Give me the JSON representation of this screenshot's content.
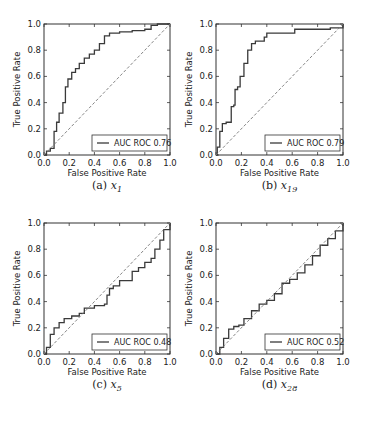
{
  "chart_data": [
    {
      "type": "line",
      "id": "a",
      "caption": {
        "label": "(a)",
        "var": "x",
        "sub": "1"
      },
      "xlabel": "False Positive Rate",
      "ylabel": "True Positive Rate",
      "xlim": [
        0,
        1
      ],
      "ylim": [
        0,
        1
      ],
      "xticks": [
        "0.0",
        "0.2",
        "0.4",
        "0.6",
        "0.8",
        "1.0"
      ],
      "yticks": [
        "0.0",
        "0.2",
        "0.4",
        "0.6",
        "0.8",
        "1.0"
      ],
      "legend": {
        "label": "AUC ROC 0.76",
        "position": "lower right"
      },
      "series": [
        {
          "name": "AUC ROC 0.76",
          "auc": 0.76,
          "x": [
            0.0,
            0.02,
            0.05,
            0.08,
            0.1,
            0.12,
            0.15,
            0.17,
            0.19,
            0.22,
            0.25,
            0.28,
            0.32,
            0.36,
            0.4,
            0.44,
            0.48,
            0.52,
            0.6,
            0.7,
            0.8,
            0.85,
            0.9,
            1.0
          ],
          "y": [
            0.0,
            0.03,
            0.05,
            0.18,
            0.25,
            0.32,
            0.4,
            0.52,
            0.58,
            0.63,
            0.66,
            0.7,
            0.74,
            0.77,
            0.8,
            0.85,
            0.91,
            0.93,
            0.94,
            0.95,
            0.96,
            0.99,
            1.0,
            1.0
          ]
        },
        {
          "name": "chance",
          "style": "dashed",
          "x": [
            0,
            1
          ],
          "y": [
            0,
            1
          ]
        }
      ]
    },
    {
      "type": "line",
      "id": "b",
      "caption": {
        "label": "(b)",
        "var": "x",
        "sub": "19"
      },
      "xlabel": "False Positive Rate",
      "ylabel": "True Positive Rate",
      "xlim": [
        0,
        1
      ],
      "ylim": [
        0,
        1
      ],
      "xticks": [
        "0.0",
        "0.2",
        "0.4",
        "0.6",
        "0.8",
        "1.0"
      ],
      "yticks": [
        "0.0",
        "0.2",
        "0.4",
        "0.6",
        "0.8",
        "1.0"
      ],
      "legend": {
        "label": "AUC ROC 0.79",
        "position": "lower right"
      },
      "series": [
        {
          "name": "AUC ROC 0.79",
          "auc": 0.79,
          "x": [
            0.0,
            0.01,
            0.03,
            0.05,
            0.08,
            0.1,
            0.12,
            0.14,
            0.15,
            0.17,
            0.19,
            0.22,
            0.25,
            0.28,
            0.31,
            0.35,
            0.38,
            0.4,
            0.5,
            0.6,
            0.62,
            0.8,
            0.9,
            1.0
          ],
          "y": [
            0.0,
            0.06,
            0.18,
            0.24,
            0.25,
            0.25,
            0.37,
            0.38,
            0.5,
            0.52,
            0.6,
            0.7,
            0.8,
            0.85,
            0.87,
            0.87,
            0.9,
            0.93,
            0.93,
            0.93,
            0.96,
            0.96,
            0.97,
            1.0
          ]
        },
        {
          "name": "chance",
          "style": "dashed",
          "x": [
            0,
            1
          ],
          "y": [
            0,
            1
          ]
        }
      ]
    },
    {
      "type": "line",
      "id": "c",
      "caption": {
        "label": "(c)",
        "var": "x",
        "sub": "5"
      },
      "xlabel": "False Positive Rate",
      "ylabel": "True Positive Rate",
      "xlim": [
        0,
        1
      ],
      "ylim": [
        0,
        1
      ],
      "xticks": [
        "0.0",
        "0.2",
        "0.4",
        "0.6",
        "0.8",
        "1.0"
      ],
      "yticks": [
        "0.0",
        "0.2",
        "0.4",
        "0.6",
        "0.8",
        "1.0"
      ],
      "legend": {
        "label": "AUC ROC 0.48",
        "position": "lower right"
      },
      "series": [
        {
          "name": "AUC ROC 0.48",
          "auc": 0.48,
          "x": [
            0.0,
            0.02,
            0.05,
            0.08,
            0.12,
            0.16,
            0.22,
            0.28,
            0.32,
            0.35,
            0.4,
            0.48,
            0.5,
            0.52,
            0.55,
            0.6,
            0.65,
            0.7,
            0.75,
            0.8,
            0.85,
            0.88,
            0.92,
            0.95,
            1.0
          ],
          "y": [
            0.0,
            0.05,
            0.15,
            0.2,
            0.24,
            0.27,
            0.29,
            0.31,
            0.35,
            0.35,
            0.37,
            0.38,
            0.45,
            0.5,
            0.52,
            0.56,
            0.56,
            0.63,
            0.66,
            0.7,
            0.73,
            0.8,
            0.87,
            0.95,
            1.0
          ]
        },
        {
          "name": "chance",
          "style": "dashed",
          "x": [
            0,
            1
          ],
          "y": [
            0,
            1
          ]
        }
      ]
    },
    {
      "type": "line",
      "id": "d",
      "caption": {
        "label": "(d)",
        "var": "x",
        "sub": "28"
      },
      "xlabel": "False Positive Rate",
      "ylabel": "True Positive Rate",
      "xlim": [
        0,
        1
      ],
      "ylim": [
        0,
        1
      ],
      "xticks": [
        "0.0",
        "0.2",
        "0.4",
        "0.6",
        "0.8",
        "1.0"
      ],
      "yticks": [
        "0.0",
        "0.2",
        "0.4",
        "0.6",
        "0.8",
        "1.0"
      ],
      "legend": {
        "label": "AUC ROC 0.52",
        "position": "lower right"
      },
      "series": [
        {
          "name": "AUC ROC 0.52",
          "auc": 0.52,
          "x": [
            0.0,
            0.03,
            0.06,
            0.1,
            0.14,
            0.18,
            0.22,
            0.28,
            0.34,
            0.4,
            0.46,
            0.52,
            0.58,
            0.64,
            0.7,
            0.76,
            0.82,
            0.88,
            0.94,
            1.0
          ],
          "y": [
            0.0,
            0.05,
            0.12,
            0.19,
            0.21,
            0.22,
            0.27,
            0.33,
            0.38,
            0.41,
            0.46,
            0.54,
            0.57,
            0.62,
            0.68,
            0.75,
            0.83,
            0.88,
            0.94,
            1.0
          ]
        },
        {
          "name": "chance",
          "style": "dashed",
          "x": [
            0,
            1
          ],
          "y": [
            0,
            1
          ]
        }
      ]
    }
  ],
  "panels": [
    {
      "left": 44,
      "top": 24,
      "width": 126,
      "height": 131,
      "cap_x": 22,
      "cap_y": 189
    },
    {
      "left": 216,
      "top": 24,
      "width": 127,
      "height": 131,
      "cap_x": 196,
      "cap_y": 189
    },
    {
      "left": 44,
      "top": 223,
      "width": 126,
      "height": 131,
      "cap_x": 22,
      "cap_y": 388
    },
    {
      "left": 216,
      "top": 223,
      "width": 127,
      "height": 131,
      "cap_x": 196,
      "cap_y": 388
    }
  ]
}
